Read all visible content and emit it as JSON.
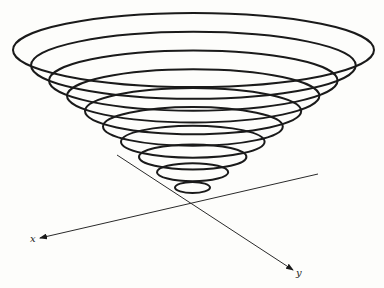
{
  "figure": {
    "type": "3d-cone-contour-diagram",
    "background": "#fdfdfb",
    "stroke_color": "#1a1a1a",
    "axes": {
      "x": {
        "label": "x",
        "start": [
          318,
          174
        ],
        "end": [
          40,
          238
        ],
        "label_pos": [
          30,
          242
        ]
      },
      "y": {
        "label": "y",
        "start": [
          117,
          155
        ],
        "end": [
          293,
          270
        ],
        "label_pos": [
          296,
          276
        ]
      }
    },
    "contours": [
      {
        "cx": 193.5,
        "cy": 50.0,
        "rx": 180.5,
        "ry": 37.0
      },
      {
        "cx": 193.4,
        "cy": 65.3,
        "rx": 162.4,
        "ry": 33.5
      },
      {
        "cx": 193.3,
        "cy": 80.6,
        "rx": 144.3,
        "ry": 30.1
      },
      {
        "cx": 193.2,
        "cy": 95.8,
        "rx": 126.2,
        "ry": 26.6
      },
      {
        "cx": 193.1,
        "cy": 111.1,
        "rx": 108.1,
        "ry": 23.1
      },
      {
        "cx": 192.9,
        "cy": 126.4,
        "rx": 89.9,
        "ry": 19.4
      },
      {
        "cx": 192.8,
        "cy": 141.7,
        "rx": 71.8,
        "ry": 16.0
      },
      {
        "cx": 192.7,
        "cy": 156.9,
        "rx": 53.7,
        "ry": 12.5
      },
      {
        "cx": 192.6,
        "cy": 172.2,
        "rx": 35.6,
        "ry": 9.0
      },
      {
        "cx": 192.5,
        "cy": 187.5,
        "rx": 17.5,
        "ry": 5.5
      }
    ]
  }
}
